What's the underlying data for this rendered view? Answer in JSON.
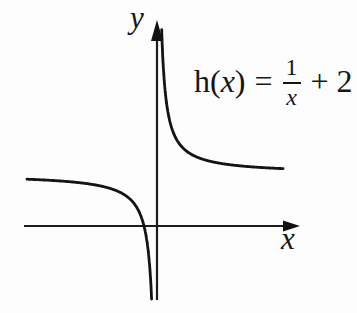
{
  "figure": {
    "background": "#fdfdfd",
    "ink": "#141414"
  },
  "equation": {
    "h_open": "h(",
    "x_var": "x",
    "close_paren": ")",
    "equals": "=",
    "numerator": "1",
    "denominator": "x",
    "plus_term": "+ 2"
  },
  "chart_data": {
    "type": "line",
    "function_label": "h(x) = 1/x + 2",
    "expression": "1/x + 2",
    "xlabel": "x",
    "ylabel": "y",
    "grid": false,
    "ticks": false,
    "legend": false,
    "asymptotes": {
      "vertical_x": 0,
      "horizontal_y": 2
    },
    "x_intercept": -0.5,
    "branches": [
      {
        "name": "left",
        "x_start": -5.0,
        "x_end": -0.19
      },
      {
        "name": "right",
        "x_start": 0.18,
        "x_end": 4.85
      }
    ],
    "sample_points": {
      "left": [
        [
          -5,
          1.8
        ],
        [
          -2,
          1.5
        ],
        [
          -1,
          1
        ],
        [
          -0.5,
          0
        ],
        [
          -0.25,
          -2
        ]
      ],
      "right": [
        [
          0.2,
          7
        ],
        [
          0.5,
          4
        ],
        [
          1,
          3
        ],
        [
          2,
          2.5
        ],
        [
          4,
          2.25
        ]
      ]
    },
    "plot_px": {
      "origin_x": 157,
      "origin_y": 226,
      "unit": 26,
      "clip_top": 26,
      "clip_bottom": 301
    },
    "axes_px": {
      "x_from": 24,
      "x_to": 300,
      "x_y": 226,
      "y_from": 20,
      "y_to": 300,
      "y_x": 157
    }
  }
}
